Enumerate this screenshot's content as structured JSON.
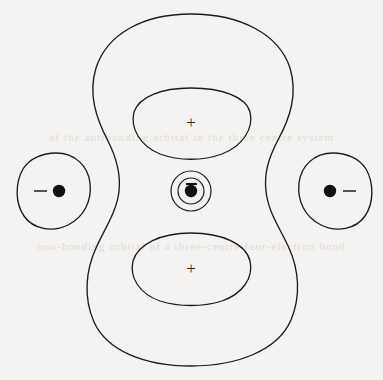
{
  "figure": {
    "background_color": "#f4f3f1",
    "line_color": "#1b1b1b",
    "width": 383,
    "height": 380
  },
  "bleed_through_text": {
    "upper_line": "of the antibonding orbital in the three centre system",
    "lower_line": "non-bonding orbital of a three-centre four-electron bond"
  },
  "regions": {
    "outer_envelope": {
      "name": "outer contour",
      "label": ""
    },
    "upper_lobe": {
      "name": "upper inner lobe",
      "sign": "+"
    },
    "lower_lobe": {
      "name": "lower inner lobe",
      "sign": "+"
    },
    "left_lobe": {
      "name": "left side lobe",
      "sign": "−"
    },
    "right_lobe": {
      "name": "right side lobe",
      "sign": "−"
    },
    "center": {
      "name": "central nucleus with concentric rings",
      "sign": "−",
      "ring_count": 2
    }
  },
  "nuclei": [
    {
      "id": "left",
      "cx": 58,
      "cy": 191
    },
    {
      "id": "center",
      "cx": 191,
      "cy": 191
    },
    {
      "id": "right",
      "cx": 331,
      "cy": 191
    }
  ],
  "signs": [
    {
      "id": "upper-plus",
      "glyph": "+",
      "x": 191,
      "y": 123
    },
    {
      "id": "lower-plus",
      "glyph": "+",
      "x": 191,
      "y": 269
    },
    {
      "id": "left-minus",
      "glyph": "−",
      "x": 40,
      "y": 191
    },
    {
      "id": "right-minus",
      "glyph": "−",
      "x": 349,
      "y": 191
    },
    {
      "id": "center-minus",
      "glyph": "−",
      "x": 191,
      "y": 184
    }
  ]
}
